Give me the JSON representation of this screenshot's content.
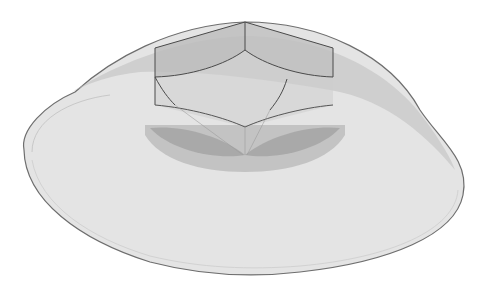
{
  "figure": {
    "subject": "Transparent dome cap enclosing a hexagonal nut",
    "view": "isometric 3D render",
    "colors": {
      "background": "#ffffff",
      "dome_fill": "#e2e2e2",
      "dome_outline": "#6e6e6e",
      "dome_band": "#bdbdbd",
      "nut_face": "#cfcfcf",
      "nut_shade": "#a9a9a9",
      "nut_edge": "#4a4a4a"
    }
  }
}
